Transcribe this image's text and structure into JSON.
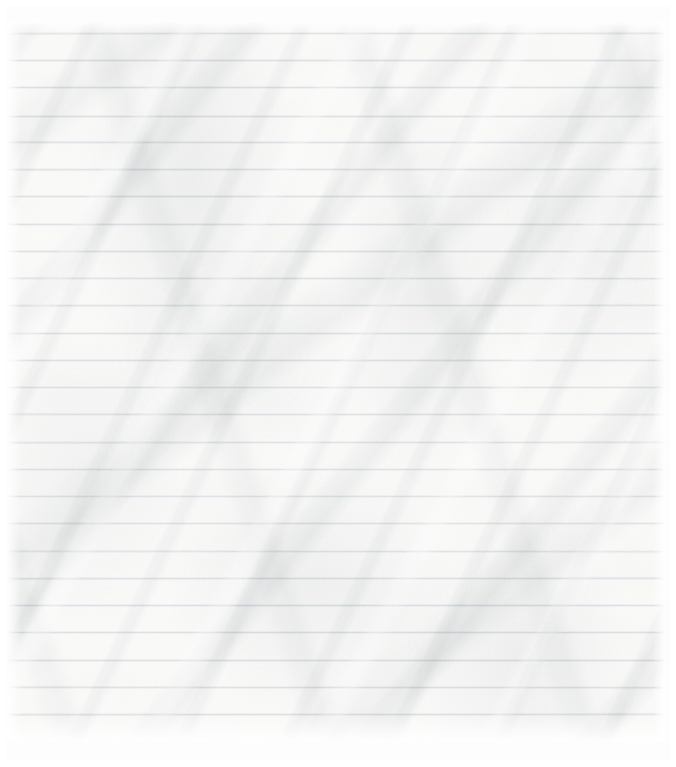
{
  "document": {
    "kind": "lined-notebook-paper",
    "title": "",
    "body_text": "",
    "handwriting": "",
    "is_blank": true,
    "orientation": "portrait"
  },
  "canvas": {
    "width": 676,
    "height": 767,
    "background_color": "#fdfdfd"
  },
  "sheet": {
    "left": 7,
    "top": 21,
    "width": 658,
    "height": 721,
    "paper_color": "#fbfbfa",
    "surface": "crumpled",
    "margin_rule": "none"
  },
  "ruling": {
    "style": "wide-ruled-horizontal",
    "line_color": "#d9dde0",
    "line_thickness_px": 1,
    "spacing_px": 27.2,
    "first_line_y": 33,
    "last_line_y": 752,
    "line_count": 27,
    "line_start_x": 8,
    "line_end_x": 665,
    "line_positions": [
      33,
      60,
      87,
      115,
      142,
      169,
      196,
      224,
      251,
      278,
      305,
      333,
      360,
      387,
      414,
      442,
      469,
      496,
      523,
      551,
      578,
      605,
      632,
      660,
      687,
      714,
      741
    ]
  },
  "creases": {
    "shadow_color": "#868e94",
    "highlight_color": "#ffffff",
    "primary_direction": "upper-right to lower-left",
    "fold_angles_deg": [
      115,
      128,
      72,
      142
    ],
    "blotch_centers": [
      {
        "x_pct": 28,
        "y_pct": 22
      },
      {
        "x_pct": 63,
        "y_pct": 38
      },
      {
        "x_pct": 88,
        "y_pct": 30
      },
      {
        "x_pct": 46,
        "y_pct": 78
      },
      {
        "x_pct": 78,
        "y_pct": 88
      },
      {
        "x_pct": 12,
        "y_pct": 62
      },
      {
        "x_pct": 34,
        "y_pct": 47
      }
    ]
  }
}
